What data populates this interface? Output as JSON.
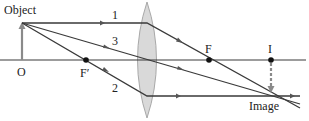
{
  "diagram": {
    "type": "converging-lens-ray-diagram",
    "labels": {
      "object": "Object",
      "origin": "O",
      "focal_near": "F′",
      "focal_far": "F",
      "image_point": "I",
      "image": "Image",
      "ray1": "1",
      "ray2": "2",
      "ray3": "3"
    },
    "colors": {
      "lens_fill": "#d9d9d9",
      "lens_stroke": "#a8a8a8",
      "object_arrow": "#8a8a8a",
      "image_arrow": "#8a8a8a",
      "ray": "#3a3a3a",
      "point": "#111111"
    }
  }
}
